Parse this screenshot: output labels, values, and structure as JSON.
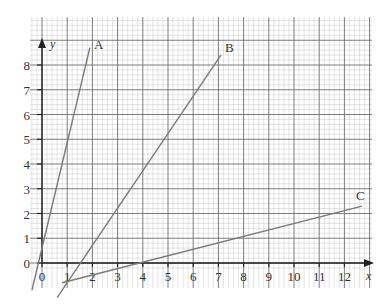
{
  "chart_data": {
    "type": "line",
    "title": "",
    "xlabel": "x",
    "ylabel": "y",
    "xlim": [
      -0.4,
      13
    ],
    "ylim": [
      -0.4,
      9.5
    ],
    "grid": true,
    "legend": "direct labels at line ends",
    "x_ticks": [
      "0",
      "1",
      "2",
      "3",
      "4",
      "5",
      "6",
      "7",
      "8",
      "9",
      "10",
      "11",
      "12"
    ],
    "y_ticks": [
      "0",
      "1",
      "2",
      "3",
      "4",
      "5",
      "6",
      "7",
      "8"
    ],
    "series": [
      {
        "name": "A",
        "points": [
          [
            -0.4,
            -1.1
          ],
          [
            1.9,
            8.7
          ]
        ],
        "note": "passes through (0,1)"
      },
      {
        "name": "B",
        "points": [
          [
            0.6,
            -1.4
          ],
          [
            7.1,
            8.4
          ]
        ],
        "note": "crosses x-axis near x=1.2"
      },
      {
        "name": "C",
        "points": [
          [
            0.8,
            -0.8
          ],
          [
            12.7,
            2.3
          ]
        ],
        "note": "crosses x-axis near x=3"
      }
    ]
  },
  "labels": {
    "x_axis": "x",
    "y_axis": "y",
    "line_a": "A",
    "line_b": "B",
    "line_c": "C",
    "x_ticks": [
      "0",
      "1",
      "2",
      "3",
      "4",
      "5",
      "6",
      "7",
      "8",
      "9",
      "10",
      "11",
      "12"
    ],
    "y_ticks": [
      "0",
      "1",
      "2",
      "3",
      "4",
      "5",
      "6",
      "7",
      "8"
    ]
  },
  "colors": {
    "grid_minor": "#c8c8c8",
    "grid_major": "#6e6e6e",
    "axis": "#222222",
    "data_line": "#7a7a7a"
  }
}
